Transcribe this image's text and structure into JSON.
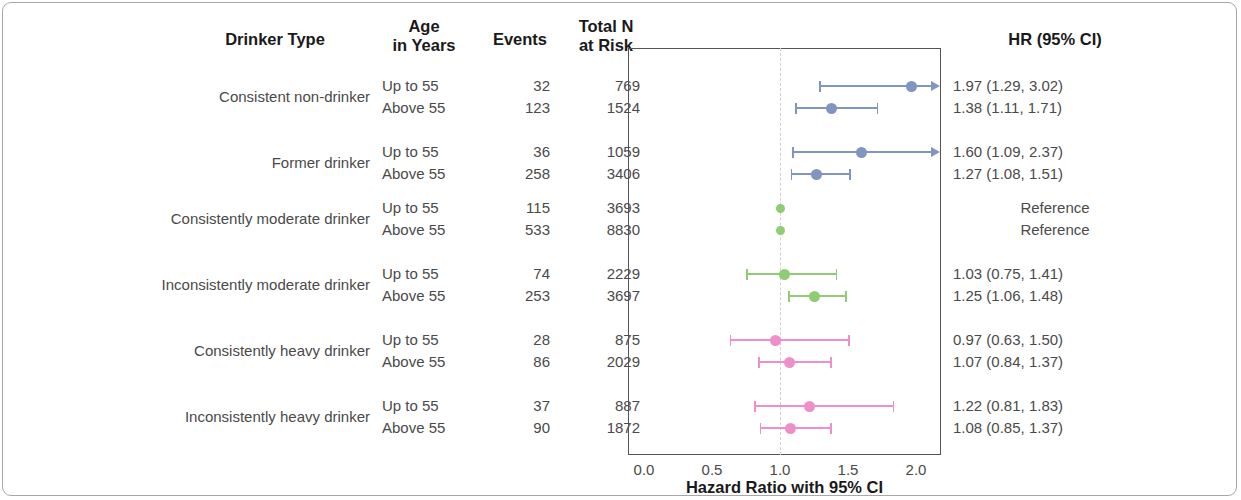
{
  "headers": {
    "drinker_type": "Drinker Type",
    "age_line1": "Age",
    "age_line2": "in Years",
    "events": "Events",
    "totaln_line1": "Total N",
    "totaln_line2": "at Risk",
    "hr": "HR (95% CI)"
  },
  "axis": {
    "title": "Hazard Ratio with 95% CI",
    "ticks": [
      "0.0",
      "0.5",
      "1.0",
      "1.5",
      "2.0"
    ]
  },
  "colors": {
    "nondrinker": "#8095c0",
    "former": "#8095c0",
    "moderate": "#8fcc74",
    "heavy": "#ef8fc8",
    "refline": "#cfcfcf",
    "text": "#4a4a4a",
    "header": "#1a1a1a"
  },
  "rows": [
    {
      "group": "Consistent non-drinker",
      "age": "Up to 55",
      "events": "32",
      "total_n": "769",
      "hr_text": "1.97 (1.29, 3.02)",
      "hr": 1.97,
      "lo": 1.29,
      "hi": 3.02,
      "color_key": "nondrinker",
      "reference": false
    },
    {
      "group": "Consistent non-drinker",
      "age": "Above 55",
      "events": "123",
      "total_n": "1524",
      "hr_text": "1.38 (1.11, 1.71)",
      "hr": 1.38,
      "lo": 1.11,
      "hi": 1.71,
      "color_key": "nondrinker",
      "reference": false
    },
    {
      "group": "Former drinker",
      "age": "Up to 55",
      "events": "36",
      "total_n": "1059",
      "hr_text": "1.60 (1.09, 2.37)",
      "hr": 1.6,
      "lo": 1.09,
      "hi": 2.37,
      "color_key": "former",
      "reference": false
    },
    {
      "group": "Former drinker",
      "age": "Above 55",
      "events": "258",
      "total_n": "3406",
      "hr_text": "1.27 (1.08, 1.51)",
      "hr": 1.27,
      "lo": 1.08,
      "hi": 1.51,
      "color_key": "former",
      "reference": false
    },
    {
      "group": "Consistently moderate drinker",
      "age": "Up to 55",
      "events": "115",
      "total_n": "3693",
      "hr_text": "Reference",
      "hr": 1.0,
      "lo": 1.0,
      "hi": 1.0,
      "color_key": "moderate",
      "reference": true
    },
    {
      "group": "Consistently moderate drinker",
      "age": "Above 55",
      "events": "533",
      "total_n": "8830",
      "hr_text": "Reference",
      "hr": 1.0,
      "lo": 1.0,
      "hi": 1.0,
      "color_key": "moderate",
      "reference": true
    },
    {
      "group": "Inconsistently moderate drinker",
      "age": "Up to 55",
      "events": "74",
      "total_n": "2229",
      "hr_text": "1.03 (0.75, 1.41)",
      "hr": 1.03,
      "lo": 0.75,
      "hi": 1.41,
      "color_key": "moderate",
      "reference": false
    },
    {
      "group": "Inconsistently moderate drinker",
      "age": "Above 55",
      "events": "253",
      "total_n": "3697",
      "hr_text": "1.25 (1.06, 1.48)",
      "hr": 1.25,
      "lo": 1.06,
      "hi": 1.48,
      "color_key": "moderate",
      "reference": false
    },
    {
      "group": "Consistently heavy drinker",
      "age": "Up to 55",
      "events": "28",
      "total_n": "875",
      "hr_text": "0.97 (0.63, 1.50)",
      "hr": 0.97,
      "lo": 0.63,
      "hi": 1.5,
      "color_key": "heavy",
      "reference": false
    },
    {
      "group": "Consistently heavy drinker",
      "age": "Above 55",
      "events": "86",
      "total_n": "2029",
      "hr_text": "1.07 (0.84, 1.37)",
      "hr": 1.07,
      "lo": 0.84,
      "hi": 1.37,
      "color_key": "heavy",
      "reference": false
    },
    {
      "group": "Inconsistently heavy drinker",
      "age": "Up to 55",
      "events": "37",
      "total_n": "887",
      "hr_text": "1.22 (0.81, 1.83)",
      "hr": 1.22,
      "lo": 0.81,
      "hi": 1.83,
      "color_key": "heavy",
      "reference": false
    },
    {
      "group": "Inconsistently heavy drinker",
      "age": "Above 55",
      "events": "90",
      "total_n": "1872",
      "hr_text": "1.08 (0.85, 1.37)",
      "hr": 1.08,
      "lo": 0.85,
      "hi": 1.37,
      "color_key": "heavy",
      "reference": false
    }
  ],
  "chart_data": {
    "type": "scatter",
    "subtype": "forest-plot",
    "title": "",
    "xlabel": "Hazard Ratio with 95% CI",
    "ylabel": "",
    "xlim": [
      0.0,
      2.18
    ],
    "xticks": [
      0.0,
      0.5,
      1.0,
      1.5,
      2.0
    ],
    "reference_line": 1.0,
    "grid": false,
    "legend": "none",
    "columns": [
      "Drinker Type",
      "Age in Years",
      "Events",
      "Total N at Risk",
      "HR (95% CI)"
    ],
    "categories": [
      "Consistent non-drinker / Up to 55",
      "Consistent non-drinker / Above 55",
      "Former drinker / Up to 55",
      "Former drinker / Above 55",
      "Consistently moderate drinker / Up to 55",
      "Consistently moderate drinker / Above 55",
      "Inconsistently moderate drinker / Up to 55",
      "Inconsistently moderate drinker / Above 55",
      "Consistently heavy drinker / Up to 55",
      "Consistently heavy drinker / Above 55",
      "Inconsistently heavy drinker / Up to 55",
      "Inconsistently heavy drinker / Above 55"
    ],
    "hazard_ratios": [
      1.97,
      1.38,
      1.6,
      1.27,
      1.0,
      1.0,
      1.03,
      1.25,
      0.97,
      1.07,
      1.22,
      1.08
    ],
    "ci_lower": [
      1.29,
      1.11,
      1.09,
      1.08,
      1.0,
      1.0,
      0.75,
      1.06,
      0.63,
      0.84,
      0.81,
      0.85
    ],
    "ci_upper": [
      3.02,
      1.71,
      2.37,
      1.51,
      1.0,
      1.0,
      1.41,
      1.48,
      1.5,
      1.37,
      1.83,
      1.37
    ],
    "events": [
      32,
      123,
      36,
      258,
      115,
      533,
      74,
      253,
      28,
      86,
      37,
      90
    ],
    "total_n": [
      769,
      1524,
      1059,
      3406,
      3693,
      8830,
      2229,
      3697,
      875,
      2029,
      887,
      1872
    ]
  }
}
